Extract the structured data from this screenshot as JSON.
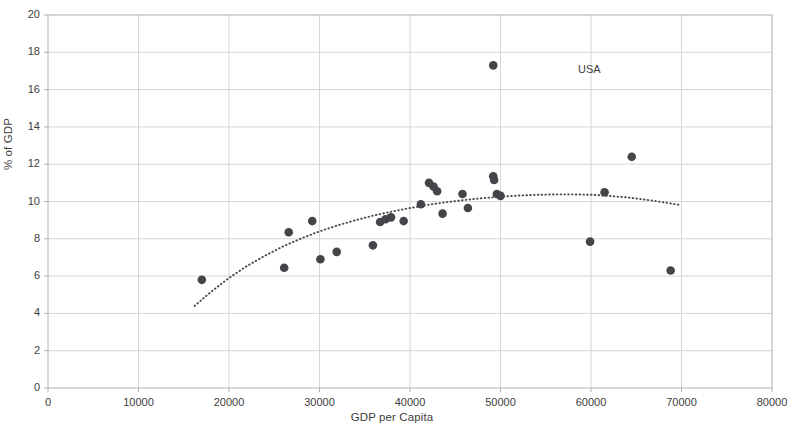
{
  "chart_data": {
    "type": "scatter",
    "title": "",
    "xlabel": "GDP per Capita",
    "ylabel": "% of GDP",
    "xlim": [
      0,
      80000
    ],
    "ylim": [
      0,
      20
    ],
    "xticks": [
      0,
      10000,
      20000,
      30000,
      40000,
      50000,
      60000,
      70000,
      80000
    ],
    "yticks": [
      0,
      2,
      4,
      6,
      8,
      10,
      12,
      14,
      16,
      18,
      20
    ],
    "grid": "both",
    "legend": {
      "position": "inside-upper-right",
      "entries": [
        "USA"
      ]
    },
    "marker_color": "#454549",
    "trendline": {
      "style": "dotted",
      "color": "#4a4a4a",
      "points": [
        [
          16200,
          4.4
        ],
        [
          18000,
          5.15
        ],
        [
          20000,
          5.9
        ],
        [
          22000,
          6.55
        ],
        [
          24000,
          7.1
        ],
        [
          26000,
          7.6
        ],
        [
          28000,
          8.02
        ],
        [
          30000,
          8.4
        ],
        [
          32000,
          8.72
        ],
        [
          34000,
          9.0
        ],
        [
          36000,
          9.25
        ],
        [
          38000,
          9.46
        ],
        [
          40000,
          9.65
        ],
        [
          42000,
          9.82
        ],
        [
          44000,
          9.96
        ],
        [
          46000,
          10.08
        ],
        [
          48000,
          10.18
        ],
        [
          50000,
          10.26
        ],
        [
          52000,
          10.32
        ],
        [
          54000,
          10.36
        ],
        [
          56000,
          10.38
        ],
        [
          58000,
          10.38
        ],
        [
          60000,
          10.36
        ],
        [
          62000,
          10.3
        ],
        [
          64000,
          10.22
        ],
        [
          66000,
          10.1
        ],
        [
          68000,
          9.96
        ],
        [
          70000,
          9.8
        ]
      ]
    },
    "series": [
      {
        "name": "Countries",
        "color": "#454549",
        "points": [
          [
            17000,
            5.8
          ],
          [
            26100,
            6.45
          ],
          [
            26600,
            8.35
          ],
          [
            29200,
            8.95
          ],
          [
            30100,
            6.9
          ],
          [
            31900,
            7.3
          ],
          [
            35900,
            7.65
          ],
          [
            36700,
            8.9
          ],
          [
            37300,
            9.05
          ],
          [
            37900,
            9.15
          ],
          [
            39300,
            8.95
          ],
          [
            41200,
            9.85
          ],
          [
            42100,
            11.0
          ],
          [
            42600,
            10.8
          ],
          [
            43000,
            10.55
          ],
          [
            43600,
            9.35
          ],
          [
            45800,
            10.4
          ],
          [
            46400,
            9.65
          ],
          [
            49200,
            11.35
          ],
          [
            49300,
            11.15
          ],
          [
            49600,
            10.4
          ],
          [
            50000,
            10.3
          ],
          [
            59900,
            7.85
          ],
          [
            61500,
            10.5
          ],
          [
            64500,
            12.4
          ],
          [
            68800,
            6.3
          ]
        ]
      },
      {
        "name": "USA",
        "color": "#454549",
        "points": [
          [
            49200,
            17.3
          ]
        ],
        "annotation": "USA"
      }
    ],
    "usa_marker": {
      "x": 49200,
      "y": 17.3,
      "label": "USA"
    }
  },
  "axes": {
    "x_title": "GDP per Capita",
    "y_title": "% of GDP",
    "x_tick_labels": [
      "0",
      "10000",
      "20000",
      "30000",
      "40000",
      "50000",
      "60000",
      "70000",
      "80000"
    ],
    "y_tick_labels": [
      "0",
      "2",
      "4",
      "6",
      "8",
      "10",
      "12",
      "14",
      "16",
      "18",
      "20"
    ]
  },
  "legend": {
    "usa_label": "USA"
  },
  "style": {
    "plot_border": "#b0b0b0",
    "grid_color": "#d6d6d6",
    "marker_color": "#454549",
    "text_color": "#3d3d3d"
  }
}
